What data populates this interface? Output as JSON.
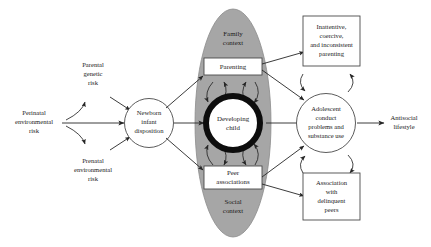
{
  "diagram": {
    "colors": {
      "context_ellipse_fill": "#a6a6a6",
      "context_ellipse_stroke": "#8c8c8c",
      "child_ring": "#0d0d0d",
      "child_fill": "#ffffff",
      "box_fill": "#ffffff",
      "box_stroke": "#4a4a4a",
      "arrow": "#262626",
      "text": "#1a1a1a",
      "background": "#ffffff"
    },
    "nodes": {
      "perinatal_risk": {
        "label": "Perinatal\nenvironmental\nrisk",
        "lines": [
          "Perinatal",
          "environmental",
          "risk"
        ],
        "shape": "plain-text"
      },
      "parental_genetic_risk": {
        "label": "Parental\ngenetic\nrisk",
        "lines": [
          "Parental",
          "genetic",
          "risk"
        ],
        "shape": "plain-text"
      },
      "prenatal_risk": {
        "label": "Prenatal\nenvironmental\nrisk",
        "lines": [
          "Prenatal",
          "environmental",
          "risk"
        ],
        "shape": "plain-text"
      },
      "newborn_disposition": {
        "label": "Newborn\ninfant\ndisposition",
        "lines": [
          "Newborn",
          "infant",
          "disposition"
        ],
        "shape": "circle"
      },
      "family_context": {
        "label": "Family\ncontext",
        "lines": [
          "Family",
          "context"
        ],
        "shape": "ellipse-region-label"
      },
      "social_context": {
        "label": "Social\ncontext",
        "lines": [
          "Social",
          "context"
        ],
        "shape": "ellipse-region-label"
      },
      "parenting": {
        "label": "Parenting",
        "lines": [
          "Parenting"
        ],
        "shape": "rectangle"
      },
      "developing_child": {
        "label": "Developing\nchild",
        "lines": [
          "Developing",
          "child"
        ],
        "shape": "thick-ring-circle"
      },
      "peer_associations": {
        "label": "Peer\nassociations",
        "lines": [
          "Peer",
          "associations"
        ],
        "shape": "rectangle"
      },
      "inattentive_parenting": {
        "label": "Inattentive, coercive, and inconsistent parenting",
        "lines": [
          "Inattentive,",
          "coercive,",
          "and inconsistent",
          "parenting"
        ],
        "shape": "rectangle"
      },
      "adolescent_outcomes": {
        "label": "Adolescent conduct problems and substance use",
        "lines": [
          "Adolescent",
          "conduct",
          "problems and",
          "substance use"
        ],
        "shape": "circle"
      },
      "delinquent_peers": {
        "label": "Association with delinquent peers",
        "lines": [
          "Association",
          "with",
          "delinquent",
          "peers"
        ],
        "shape": "rectangle"
      },
      "antisocial_lifestyle": {
        "label": "Antisocial\nlifestyle",
        "lines": [
          "Antisocial",
          "lifestyle"
        ],
        "shape": "plain-text"
      }
    },
    "edges": [
      {
        "from": "perinatal_risk",
        "to": "newborn_disposition",
        "style": "straight",
        "arrow": "single"
      },
      {
        "from": "perinatal_risk",
        "to": "parental_genetic_risk",
        "style": "curved",
        "arrow": "single"
      },
      {
        "from": "perinatal_risk",
        "to": "prenatal_risk",
        "style": "curved",
        "arrow": "single"
      },
      {
        "from": "parental_genetic_risk",
        "to": "newborn_disposition",
        "style": "straight",
        "arrow": "single"
      },
      {
        "from": "prenatal_risk",
        "to": "newborn_disposition",
        "style": "straight",
        "arrow": "single"
      },
      {
        "from": "newborn_disposition",
        "to": "parenting",
        "style": "straight",
        "arrow": "single"
      },
      {
        "from": "newborn_disposition",
        "to": "developing_child",
        "style": "straight",
        "arrow": "single"
      },
      {
        "from": "newborn_disposition",
        "to": "peer_associations",
        "style": "straight",
        "arrow": "single"
      },
      {
        "from": "parenting",
        "to": "developing_child",
        "style": "curved",
        "arrow": "bidirectional"
      },
      {
        "from": "peer_associations",
        "to": "developing_child",
        "style": "curved",
        "arrow": "bidirectional"
      },
      {
        "from": "parenting",
        "to": "inattentive_parenting",
        "style": "straight",
        "arrow": "single"
      },
      {
        "from": "parenting",
        "to": "adolescent_outcomes",
        "style": "straight",
        "arrow": "single"
      },
      {
        "from": "developing_child",
        "to": "adolescent_outcomes",
        "style": "straight",
        "arrow": "single"
      },
      {
        "from": "peer_associations",
        "to": "adolescent_outcomes",
        "style": "straight",
        "arrow": "single"
      },
      {
        "from": "peer_associations",
        "to": "delinquent_peers",
        "style": "straight",
        "arrow": "single"
      },
      {
        "from": "inattentive_parenting",
        "to": "adolescent_outcomes",
        "style": "curved",
        "arrow": "bidirectional"
      },
      {
        "from": "delinquent_peers",
        "to": "adolescent_outcomes",
        "style": "curved",
        "arrow": "bidirectional"
      },
      {
        "from": "adolescent_outcomes",
        "to": "antisocial_lifestyle",
        "style": "straight",
        "arrow": "single"
      }
    ]
  }
}
